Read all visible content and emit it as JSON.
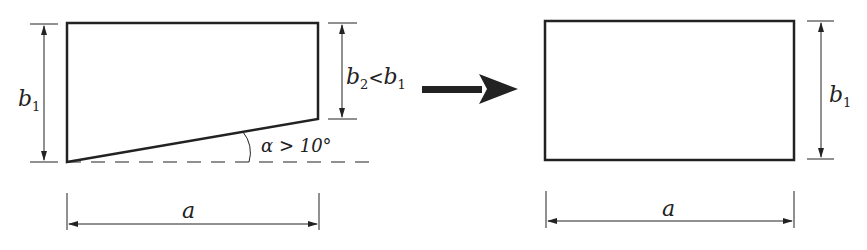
{
  "diagram": {
    "left_figure": {
      "label_b1": "b",
      "label_b1_sub": "1",
      "label_b2": "b",
      "label_b2_sub": "2",
      "label_lt": "<",
      "label_b2_rhs": "b",
      "label_b2_rhs_sub": "1",
      "angle_label": "α > 10°",
      "width_label": "a"
    },
    "transform_arrow": "→",
    "right_figure": {
      "label_b1": "b",
      "label_b1_sub": "1",
      "width_label": "a"
    },
    "colors": {
      "stroke": "#222222",
      "background": "#ffffff"
    }
  }
}
